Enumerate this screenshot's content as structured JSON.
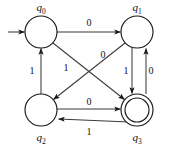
{
  "diagram": {
    "type": "finite-state-automaton",
    "title": "",
    "colors": {
      "background": "#ffffff",
      "node_stroke": "#1a1a1a",
      "node_fill": "#ffffff",
      "edge_stroke": "#3b3b3b",
      "text": "#111111"
    },
    "states": [
      {
        "id": "q0",
        "name": "q",
        "subscript": "0",
        "label": "q0",
        "cx": 41,
        "cy": 32,
        "r": 16,
        "accepting": false,
        "start": true,
        "label_x": 41,
        "label_y": 11
      },
      {
        "id": "q1",
        "name": "q",
        "subscript": "1",
        "label": "q1",
        "cx": 137,
        "cy": 32,
        "r": 16,
        "accepting": false,
        "start": false,
        "label_x": 137,
        "label_y": 11
      },
      {
        "id": "q2",
        "name": "q",
        "subscript": "2",
        "label": "q2",
        "cx": 41,
        "cy": 110,
        "r": 16,
        "accepting": false,
        "start": false,
        "label_x": 41,
        "label_y": 140
      },
      {
        "id": "q3",
        "name": "q",
        "subscript": "3",
        "label": "q3",
        "cx": 137,
        "cy": 110,
        "r": 16,
        "r_inner": 12,
        "accepting": true,
        "start": false,
        "label_x": 137,
        "label_y": 140
      }
    ],
    "start_arrow": {
      "name": "start-arrow",
      "from_x": 8,
      "to_x": 25,
      "y": 32
    },
    "transitions": [
      {
        "id": "t-q0-q1",
        "from": "q0",
        "to": "q1",
        "symbol": "0",
        "label_x": 89,
        "label_y": 25,
        "shape": "top-horizontal"
      },
      {
        "id": "t-q0-q3",
        "from": "q0",
        "to": "q3",
        "symbol": "1",
        "label_x": 66,
        "label_y": 68,
        "shape": "diagonal-down-right"
      },
      {
        "id": "t-q1-q2",
        "from": "q1",
        "to": "q2",
        "symbol": "0",
        "label_x": 103,
        "label_y": 56,
        "shape": "diagonal-down-left"
      },
      {
        "id": "t-q1-q3",
        "from": "q1",
        "to": "q3",
        "symbol": "1",
        "label_x": 126,
        "label_y": 71,
        "shape": "right-vertical-down"
      },
      {
        "id": "t-q2-q0",
        "from": "q2",
        "to": "q0",
        "symbol": "1",
        "label_x": 33,
        "label_y": 71,
        "shape": "left-vertical-up"
      },
      {
        "id": "t-q2-q3",
        "from": "q2",
        "to": "q3",
        "symbol": "0",
        "label_x": 89,
        "label_y": 104,
        "shape": "bottom-horizontal-right"
      },
      {
        "id": "t-q3-q1",
        "from": "q3",
        "to": "q1",
        "symbol": "0",
        "label_x": 150,
        "label_y": 71,
        "shape": "right-vertical-up"
      },
      {
        "id": "t-q3-q2",
        "from": "q3",
        "to": "q2",
        "symbol": "1",
        "label_x": 89,
        "label_y": 134,
        "shape": "bottom-horizontal-left"
      }
    ]
  }
}
